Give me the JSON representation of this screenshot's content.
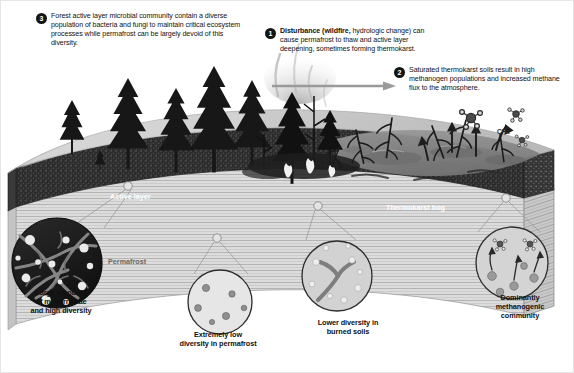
{
  "diagram": {
    "colors": {
      "badge_fill": "#141414",
      "badge_text": "#ffffff",
      "active_layer": "#2b2b2b",
      "permafrost": "#d9d9d9",
      "ground_surface": "#cfcfcf",
      "bog_water": "#8e8e8e",
      "arrow": "#8a8a8a",
      "text": "#111111",
      "label_light": "#ffffff",
      "label_gray": "#6a6a6a",
      "inset_dark_fill": "#1c1c1c",
      "inset_light_fill": "#e3e3e3",
      "inset_mid_fill": "#c9c9c9",
      "frame": "#bdbdbd"
    }
  },
  "callouts": [
    {
      "number": "1",
      "bold_lead": "Disturbance (wildfire,",
      "rest": " hydrologic change) can cause permafrost to thaw and active layer deepening, sometimes forming thermokarst."
    },
    {
      "number": "2",
      "bold_lead": "",
      "rest": "Saturated thermokarst soils result in high methanogen populations and increased methane flux to the atmosphere."
    },
    {
      "number": "3",
      "bold_lead": "",
      "rest": "Forest active layer microbial community contain a diverse population of bacteria and fungi to maintain critical ecosystem processes while permafrost can be largely devoid of this diversity."
    }
  ],
  "scene_labels": {
    "active_layer": "Active layer",
    "thermokarst_bog": "Thermokarst bog",
    "permafrost": "Permafrost",
    "methane_formula": "CH₄"
  },
  "insets": [
    {
      "id": "mycorrhizae",
      "caption_line1": "Large amounts",
      "caption_line2": "of mycorrhizae",
      "caption_line3": "and high diversity",
      "style": "dark",
      "depicts": "dense fungal hyphae network with many spores"
    },
    {
      "id": "permafrost-diversity",
      "caption_line1": "Extremely low",
      "caption_line2": "diversity in permafrost",
      "caption_line3": "",
      "style": "light",
      "depicts": "few scattered microbial cells"
    },
    {
      "id": "burned-soils",
      "caption_line1": "Lower diversity in",
      "caption_line2": "burned soils",
      "caption_line3": "",
      "style": "mid",
      "depicts": "single hypha strand with scattered cells"
    },
    {
      "id": "methanogenic",
      "caption_line1": "Dominantly",
      "caption_line2": "methanogenic",
      "caption_line3": "community",
      "style": "mid",
      "depicts": "methanogen cells emitting methane molecules upward"
    }
  ],
  "arrow": {
    "name": "transition-arrow",
    "direction": "right",
    "meaning": "forest to thermokarst bog transition"
  }
}
